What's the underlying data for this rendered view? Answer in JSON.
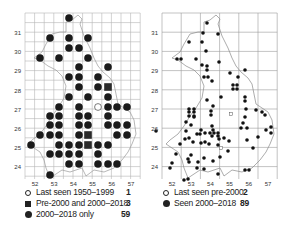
{
  "left_map": {
    "x_ticks": [
      "52",
      "53",
      "54",
      "55",
      "56",
      "57"
    ],
    "y_ticks": [
      "31",
      "30",
      "29",
      "28",
      "27",
      "26",
      "25",
      "24"
    ],
    "legend": [
      {
        "symbol": "open-circle",
        "label": "Last seen 1950–1999",
        "count": "1"
      },
      {
        "symbol": "filled-square",
        "label": "Pre-2000 and 2000–2018",
        "count": "3"
      },
      {
        "symbol": "filled-circle",
        "label": "2000–2018 only",
        "count": "59"
      }
    ],
    "dots": [
      [
        69,
        18
      ],
      [
        50,
        38
      ],
      [
        69,
        38
      ],
      [
        88,
        38
      ],
      [
        69,
        48
      ],
      [
        79,
        48
      ],
      [
        40,
        58
      ],
      [
        59,
        58
      ],
      [
        88,
        58
      ],
      [
        79,
        67
      ],
      [
        108,
        67
      ],
      [
        69,
        77
      ],
      [
        79,
        77
      ],
      [
        98,
        77
      ],
      [
        79,
        87
      ],
      [
        98,
        87
      ],
      [
        69,
        97
      ],
      [
        88,
        97
      ],
      [
        108,
        97
      ],
      [
        59,
        107
      ],
      [
        79,
        107
      ],
      [
        108,
        107
      ],
      [
        117,
        107
      ],
      [
        127,
        107
      ],
      [
        50,
        116
      ],
      [
        59,
        116
      ],
      [
        79,
        116
      ],
      [
        88,
        116
      ],
      [
        108,
        116
      ],
      [
        50,
        125
      ],
      [
        59,
        125
      ],
      [
        79,
        125
      ],
      [
        88,
        125
      ],
      [
        108,
        125
      ],
      [
        117,
        125
      ],
      [
        127,
        125
      ],
      [
        40,
        135
      ],
      [
        50,
        135
      ],
      [
        59,
        135
      ],
      [
        79,
        135
      ],
      [
        117,
        135
      ],
      [
        127,
        135
      ],
      [
        31,
        145
      ],
      [
        59,
        145
      ],
      [
        69,
        145
      ],
      [
        79,
        145
      ],
      [
        98,
        145
      ],
      [
        108,
        145
      ],
      [
        50,
        154
      ],
      [
        59,
        154
      ],
      [
        69,
        154
      ],
      [
        79,
        154
      ],
      [
        98,
        154
      ],
      [
        69,
        164
      ],
      [
        79,
        164
      ],
      [
        98,
        164
      ],
      [
        108,
        164
      ],
      [
        117,
        164
      ],
      [
        50,
        175
      ]
    ],
    "squares": [
      [
        108,
        87
      ],
      [
        88,
        135
      ],
      [
        88,
        145
      ]
    ],
    "open": [
      [
        98,
        107
      ]
    ]
  },
  "right_map": {
    "x_ticks": [
      "52",
      "53",
      "54",
      "55",
      "56",
      "57"
    ],
    "y_ticks": [
      "31",
      "30",
      "29",
      "28",
      "27",
      "26",
      "25",
      "24"
    ],
    "legend": [
      {
        "symbol": "open-circle",
        "label": "Last seen pre-2000",
        "count": "2"
      },
      {
        "symbol": "filled-circle",
        "label": "Seen 2000–2018",
        "count": "89"
      }
    ],
    "dots": [
      [
        207,
        23
      ],
      [
        203,
        33
      ],
      [
        218,
        34
      ],
      [
        189,
        42
      ],
      [
        202,
        42
      ],
      [
        206,
        51
      ],
      [
        177,
        59
      ],
      [
        181,
        59
      ],
      [
        196,
        59
      ],
      [
        202,
        65
      ],
      [
        219,
        62
      ],
      [
        207,
        66
      ],
      [
        207,
        70
      ],
      [
        204,
        77
      ],
      [
        208,
        77
      ],
      [
        212,
        81
      ],
      [
        230,
        73
      ],
      [
        245,
        70
      ],
      [
        238,
        77
      ],
      [
        233,
        85
      ],
      [
        237,
        85
      ],
      [
        233,
        89
      ],
      [
        237,
        89
      ],
      [
        245,
        97
      ],
      [
        245,
        101
      ],
      [
        207,
        100
      ],
      [
        221,
        97
      ],
      [
        213,
        106
      ],
      [
        189,
        109
      ],
      [
        194,
        109
      ],
      [
        189,
        112
      ],
      [
        194,
        112
      ],
      [
        189,
        116
      ],
      [
        194,
        116
      ],
      [
        211,
        111
      ],
      [
        211,
        115
      ],
      [
        246,
        109
      ],
      [
        256,
        110
      ],
      [
        243,
        123
      ],
      [
        245,
        117
      ],
      [
        262,
        112
      ],
      [
        265,
        115
      ],
      [
        194,
        117
      ],
      [
        186,
        122
      ],
      [
        191,
        125
      ],
      [
        212,
        126
      ],
      [
        201,
        130
      ],
      [
        213,
        130
      ],
      [
        205,
        133
      ],
      [
        210,
        133
      ],
      [
        214,
        133
      ],
      [
        218,
        133
      ],
      [
        212,
        136
      ],
      [
        218,
        136
      ],
      [
        219,
        139
      ],
      [
        224,
        138
      ],
      [
        229,
        141
      ],
      [
        241,
        128
      ],
      [
        247,
        128
      ],
      [
        266,
        130
      ],
      [
        271,
        127
      ],
      [
        271,
        133
      ],
      [
        258,
        137
      ],
      [
        186,
        131
      ],
      [
        197,
        134
      ],
      [
        200,
        134
      ],
      [
        185,
        139
      ],
      [
        189,
        138
      ],
      [
        180,
        144
      ],
      [
        193,
        142
      ],
      [
        201,
        143
      ],
      [
        205,
        142
      ],
      [
        209,
        144
      ],
      [
        218,
        145
      ],
      [
        228,
        151
      ],
      [
        247,
        140
      ],
      [
        253,
        148
      ],
      [
        191,
        155
      ],
      [
        188,
        159
      ],
      [
        189,
        162
      ],
      [
        198,
        162
      ],
      [
        204,
        158
      ],
      [
        213,
        161
      ],
      [
        172,
        163
      ],
      [
        170,
        168
      ],
      [
        204,
        169
      ],
      [
        218,
        174
      ],
      [
        245,
        170
      ],
      [
        249,
        170
      ],
      [
        184,
        180
      ],
      [
        188,
        179
      ],
      [
        197,
        168
      ],
      [
        220,
        157
      ],
      [
        156,
        131
      ],
      [
        176,
        154
      ]
    ],
    "open": [
      [
        231,
        114
      ],
      [
        221,
        148
      ]
    ]
  }
}
